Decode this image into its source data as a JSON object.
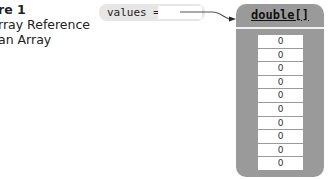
{
  "caption": {
    "line1": "re 1",
    "line2": "rray Reference",
    "line3": "an Array"
  },
  "variable": {
    "label": "values =",
    "value": ""
  },
  "array": {
    "type": "double[]",
    "cells": [
      "0",
      "0",
      "0",
      "0",
      "0",
      "0",
      "0",
      "0",
      "0",
      "0"
    ]
  },
  "colors": {
    "array_box": "#9a9a9a",
    "variable_pill": "#e6e6e6",
    "cell": "#ffffff",
    "pointer": "#555555"
  }
}
